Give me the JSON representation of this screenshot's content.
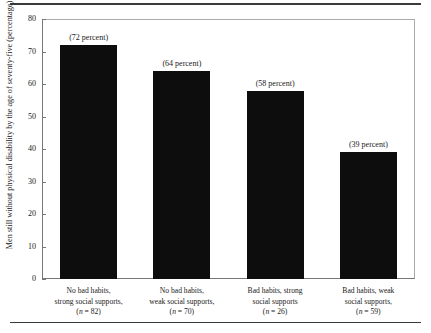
{
  "chart_data": {
    "type": "bar",
    "title": "",
    "xlabel": "",
    "ylabel": "Men still without physical disability by the age of seventy-five (percentage)",
    "ylim": [
      0,
      80
    ],
    "yticks": [
      0,
      10,
      20,
      30,
      40,
      50,
      60,
      70,
      80
    ],
    "grid": false,
    "legend": "none",
    "bar_color": "#0d0d0d",
    "categories": [
      "No bad habits, strong social supports, (n = 82)",
      "No bad habits, weak social supports, (n = 70)",
      "Bad habits, strong social supports (n = 26)",
      "Bad habits, weak social supports, (n = 59)"
    ],
    "values": [
      72,
      64,
      58,
      39
    ],
    "data_labels": [
      "(72 percent)",
      "(64 percent)",
      "(58 percent)",
      "(39 percent)"
    ],
    "category_lines": [
      [
        "No bad habits,",
        "strong social supports,",
        "(n = 82)"
      ],
      [
        "No bad habits,",
        "weak social supports,",
        "(n = 70)"
      ],
      [
        "Bad habits, strong",
        "social supports",
        "(n = 26)"
      ],
      [
        "Bad habits, weak",
        "social supports,",
        "(n = 59)"
      ]
    ],
    "n_values": [
      82,
      70,
      26,
      59
    ]
  },
  "axis": {
    "y_tick_labels": [
      "80",
      "70",
      "60",
      "50",
      "40",
      "30",
      "20",
      "10",
      "0"
    ],
    "y_title": "Men still without physical disability by the age of seventy-five (percentage)"
  }
}
